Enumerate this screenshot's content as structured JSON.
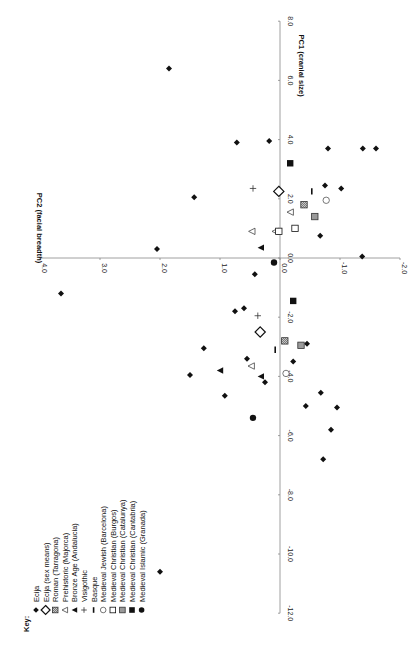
{
  "chart_data": {
    "type": "scatter",
    "orientation": "rotated-90-ccw",
    "title": "",
    "xlabel": "PC1 (cranial size)",
    "ylabel": "PC2 (facial breadth)",
    "xlim": [
      -12.0,
      8.0
    ],
    "ylim": [
      -2.0,
      4.0
    ],
    "x_ticks": [
      "-12.0",
      "-10.0",
      "-8.0",
      "-6.0",
      "-4.0",
      "-2.0",
      "0.0",
      "2.0",
      "4.0",
      "6.0",
      "8.0"
    ],
    "y_ticks": [
      "-2.0",
      "-1.0",
      "0.0",
      "1.0",
      "2.0",
      "3.0",
      "4.0"
    ],
    "legend_title": "Key:",
    "legend_position": "lower-left (rotated)",
    "series": [
      {
        "name": "Ecija",
        "marker": "filled-diamond",
        "points": [
          [
            6.4,
            1.85
          ],
          [
            -1.2,
            3.65
          ],
          [
            0.3,
            2.05
          ],
          [
            3.9,
            0.72
          ],
          [
            2.05,
            1.43
          ],
          [
            3.95,
            0.18
          ],
          [
            3.7,
            -0.8
          ],
          [
            3.7,
            -1.38
          ],
          [
            3.7,
            -1.6
          ],
          [
            2.45,
            -0.75
          ],
          [
            2.35,
            -1.02
          ],
          [
            0.75,
            -0.67
          ],
          [
            0.05,
            -1.37
          ],
          [
            -1.8,
            0.75
          ],
          [
            -3.05,
            1.27
          ],
          [
            -2.9,
            -0.45
          ],
          [
            -3.4,
            0.55
          ],
          [
            -3.95,
            1.5
          ],
          [
            -4.65,
            0.92
          ],
          [
            -4.55,
            -0.68
          ],
          [
            -5.0,
            -0.43
          ],
          [
            -6.8,
            -0.72
          ],
          [
            -5.8,
            -0.85
          ],
          [
            -3.5,
            -0.22
          ],
          [
            -5.05,
            -0.95
          ],
          [
            -10.6,
            2.0
          ],
          [
            -1.7,
            0.6
          ],
          [
            -0.55,
            0.42
          ],
          [
            -4.2,
            0.25
          ]
        ]
      },
      {
        "name": "Ecija (sex means)",
        "marker": "open-diamond",
        "points": [
          [
            2.25,
            0.02
          ],
          [
            -2.5,
            0.33
          ]
        ]
      },
      {
        "name": "Roman (Tarragona)",
        "marker": "hatched-square",
        "points": [
          [
            1.8,
            -0.4
          ],
          [
            -2.8,
            -0.08
          ]
        ]
      },
      {
        "name": "Prehistoric (Majorca)",
        "marker": "open-triangle",
        "points": [
          [
            1.55,
            -0.17
          ],
          [
            0.9,
            0.47
          ],
          [
            0.9,
            0.08
          ],
          [
            -3.65,
            0.48
          ]
        ]
      },
      {
        "name": "Bronze Age (Andalucia)",
        "marker": "filled-triangle",
        "points": [
          [
            0.35,
            0.32
          ],
          [
            -3.8,
            1.0
          ],
          [
            -4.0,
            0.32
          ]
        ]
      },
      {
        "name": "Visigothic",
        "marker": "plus",
        "points": [
          [
            2.35,
            0.45
          ],
          [
            -1.95,
            0.37
          ]
        ]
      },
      {
        "name": "Basque",
        "marker": "dash",
        "points": [
          [
            2.25,
            -0.53
          ],
          [
            -3.1,
            0.08
          ]
        ]
      },
      {
        "name": "Medieval Jewish (Barcelona)",
        "marker": "open-circle",
        "points": [
          [
            1.95,
            -0.77
          ],
          [
            -3.9,
            -0.1
          ]
        ]
      },
      {
        "name": "Medieval Christian (Burgos)",
        "marker": "open-square",
        "points": [
          [
            0.9,
            0.02
          ],
          [
            1.0,
            -0.25
          ]
        ]
      },
      {
        "name": "Medieval Christian (Catalunya)",
        "marker": "gray-square",
        "points": [
          [
            1.4,
            -0.58
          ],
          [
            -2.95,
            -0.35
          ]
        ]
      },
      {
        "name": "Medieval Christian (Cantabria)",
        "marker": "filled-square",
        "points": [
          [
            3.2,
            -0.17
          ],
          [
            -1.45,
            -0.22
          ]
        ]
      },
      {
        "name": "Medieval Islamic (Granada)",
        "marker": "filled-circle",
        "points": [
          [
            -0.15,
            0.1
          ],
          [
            -5.4,
            0.45
          ]
        ]
      }
    ]
  },
  "legend": {
    "title": "Key:",
    "items": [
      {
        "label": "Ecija",
        "marker": "filled-diamond"
      },
      {
        "label": "Ecija (sex means)",
        "marker": "open-diamond"
      },
      {
        "label": "Roman (Tarragona)",
        "marker": "hatched-square"
      },
      {
        "label": "Prehistoric (Majorca)",
        "marker": "open-triangle"
      },
      {
        "label": "Bronze Age (Andalucia)",
        "marker": "filled-triangle"
      },
      {
        "label": "Visigothic",
        "marker": "plus"
      },
      {
        "label": "Basque",
        "marker": "dash"
      },
      {
        "label": "Medieval Jewish (Barcelona)",
        "marker": "open-circle"
      },
      {
        "label": "Medieval Christian (Burgos)",
        "marker": "open-square"
      },
      {
        "label": "Medieval Christian (Catalunya)",
        "marker": "gray-square"
      },
      {
        "label": "Medieval Christian (Cantabria)",
        "marker": "filled-square"
      },
      {
        "label": "Medieval Islamic (Granada)",
        "marker": "filled-circle"
      }
    ]
  },
  "colors": {
    "ink": "#111111",
    "axis": "#888888",
    "gray_fill": "#9a9a9a",
    "hatch_fill": "#7a7a7a"
  }
}
